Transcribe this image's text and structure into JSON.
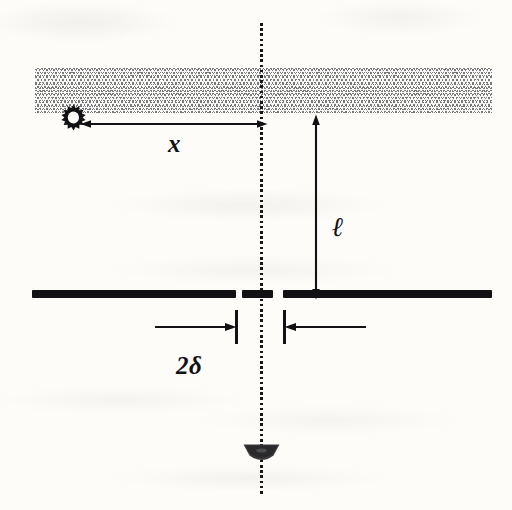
{
  "figure": {
    "background_color": "#fdfcf9",
    "ink_color": "#121215",
    "hatch_color": "#6e6e6e",
    "width": 512,
    "height": 510
  },
  "labels": {
    "distance_x": "x",
    "distance_ell": "ℓ",
    "slit_separation": "2δ"
  },
  "elements": {
    "hatch_band_name": "hatched-medium-band",
    "light_source_name": "light-source-starburst",
    "center_axis_name": "optical-axis-dotted-line",
    "barrier_name": "slit-barrier",
    "detector_name": "detector-lens"
  },
  "geometry": {
    "hatch_band": {
      "x": 35,
      "y": 68,
      "width": 457,
      "height": 45
    },
    "center_axis_x": 261,
    "light_source": {
      "cx": 73,
      "cy": 117
    },
    "x_arrow": {
      "x1": 85,
      "x2": 262,
      "y": 124
    },
    "ell_arrow": {
      "x": 316,
      "y1": 120,
      "y2": 295
    },
    "barrier_y": 294,
    "barrier_segments": [
      {
        "x": 32,
        "width": 204
      },
      {
        "x": 242,
        "width": 31
      },
      {
        "x": 283,
        "width": 209
      }
    ],
    "slit_ticks_x": [
      236,
      284
    ],
    "detector": {
      "cx": 261,
      "cy": 452
    }
  }
}
